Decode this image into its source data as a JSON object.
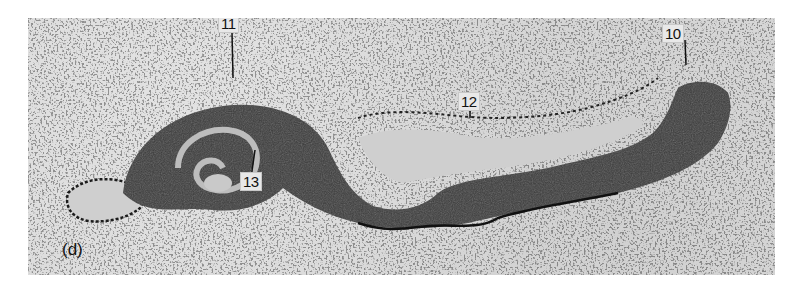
{
  "figure": {
    "panel_letter": "(d)",
    "background_color": "#d9d9d9",
    "labels": [
      {
        "id": "label-10",
        "text": "10"
      },
      {
        "id": "label-11",
        "text": "11"
      },
      {
        "id": "label-12",
        "text": "12"
      },
      {
        "id": "label-13",
        "text": "13"
      }
    ]
  }
}
